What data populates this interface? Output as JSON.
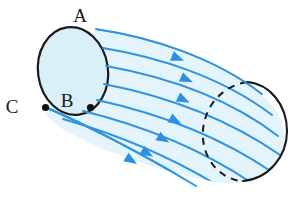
{
  "figure": {
    "background_color": "#ffffff",
    "labels": [
      {
        "id": "A",
        "text": "A",
        "x": 80,
        "y": 22,
        "description": "top of near-end cross-section"
      },
      {
        "id": "B",
        "text": "B",
        "x": 67,
        "y": 107,
        "description": "interior of near-end cross-section"
      },
      {
        "id": "C",
        "text": "C",
        "x": 12,
        "y": 113,
        "description": "left boundary point of near-end cross-section"
      }
    ],
    "markers": [
      {
        "id": "dot-left",
        "x": 45.5,
        "y": 107.5,
        "r": 3.6,
        "color": "#111111"
      },
      {
        "id": "dot-right",
        "x": 90.5,
        "y": 107.5,
        "r": 3.6,
        "color": "#111111"
      }
    ],
    "near_cap": {
      "type": "ellipse",
      "cx": 73,
      "cy": 71,
      "rx": 35,
      "ry": 44,
      "rotation_deg": -8,
      "fill": "#d9f0f9",
      "stroke": "#1a1a1a",
      "stroke_width": 2.2
    },
    "far_cap": {
      "type": "ellipse",
      "cx": 247,
      "cy": 130,
      "rx": 40,
      "ry": 52,
      "rotation_deg": -8,
      "visible_arc": "solid-right-half",
      "hidden_arc": "dashed-left-half",
      "stroke": "#1a1a1a",
      "stroke_width": 2.0,
      "dash_pattern": "7 6"
    },
    "tube_body": {
      "fill": "#e3f4fc",
      "description": "swept cylindrical surface between near cap and far cap"
    },
    "stream_lines": {
      "count": 8,
      "color": "#2f93e0",
      "stroke_width": 2.0,
      "arrow_color": "#2f8fdf",
      "direction": "left-to-right",
      "arrowheads_per_line": 1
    },
    "colors": {
      "flow_line": "#2f93e0",
      "flow_line_dark": "#1f7fd0",
      "cap_fill": "#d9f0f9",
      "tube_fill": "#e3f4fc",
      "outline": "#1a1a1a",
      "marker": "#111111",
      "background": "#ffffff"
    }
  }
}
